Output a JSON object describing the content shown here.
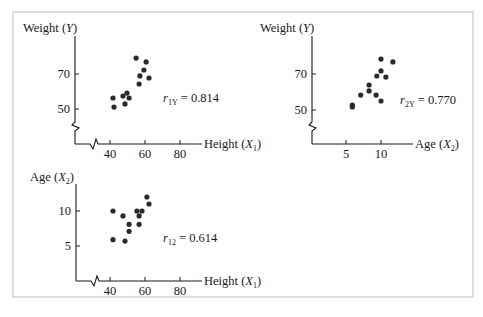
{
  "figure": {
    "frame_color": "#c9c9c9",
    "point_color": "#2a2a2a",
    "axis_color": "#1a1a1a"
  },
  "chart_data": [
    {
      "type": "scatter",
      "id": "height_vs_weight",
      "xlabel": "Height (X1)",
      "xlabel_main": "Height (",
      "xlabel_var": "X",
      "xlabel_sub": "1",
      "ylabel": "Weight (Y)",
      "ylabel_main": "Weight (",
      "ylabel_var": "Y",
      "ylabel_sub": "",
      "x_ticks": [
        40,
        60,
        80
      ],
      "y_ticks": [
        50,
        70
      ],
      "x_break": true,
      "y_break": true,
      "annotation": {
        "var": "r",
        "sub": "1Y",
        "text": " = 0.814",
        "value": 0.814
      },
      "points": [
        {
          "x": 54.9,
          "y": 79.1
        },
        {
          "x": 60.6,
          "y": 76.9
        },
        {
          "x": 59.4,
          "y": 72.3
        },
        {
          "x": 57.1,
          "y": 68.9
        },
        {
          "x": 62.3,
          "y": 67.7
        },
        {
          "x": 56.6,
          "y": 64.3
        },
        {
          "x": 49.7,
          "y": 59.1
        },
        {
          "x": 47.4,
          "y": 57.4
        },
        {
          "x": 50.9,
          "y": 56.3
        },
        {
          "x": 41.7,
          "y": 56.3
        },
        {
          "x": 48.6,
          "y": 52.9
        },
        {
          "x": 42.3,
          "y": 51.1
        }
      ],
      "layout": {
        "origin_px": [
          75,
          144
        ],
        "x_ref": [
          40,
          110
        ],
        "x_scale": 1.75,
        "y_ref": [
          50,
          109
        ],
        "y_scale": 1.75,
        "x_axis_end": 202,
        "y_axis_top": 36
      }
    },
    {
      "type": "scatter",
      "id": "age_vs_weight",
      "xlabel": "Age (X2)",
      "xlabel_main": "Age (",
      "xlabel_var": "X",
      "xlabel_sub": "2",
      "ylabel": "Weight (Y)",
      "ylabel_main": "Weight (",
      "ylabel_var": "Y",
      "ylabel_sub": "",
      "x_ticks": [
        5,
        10
      ],
      "y_ticks": [
        50,
        70
      ],
      "x_break": false,
      "y_break": true,
      "annotation": {
        "var": "r",
        "sub": "2Y",
        "text": " = 0.770",
        "value": 0.77
      },
      "points": [
        {
          "x": 10.0,
          "y": 78.3
        },
        {
          "x": 11.7,
          "y": 76.7
        },
        {
          "x": 10.0,
          "y": 71.7
        },
        {
          "x": 9.4,
          "y": 68.9
        },
        {
          "x": 10.7,
          "y": 68.3
        },
        {
          "x": 8.3,
          "y": 63.9
        },
        {
          "x": 8.3,
          "y": 60.6
        },
        {
          "x": 7.1,
          "y": 58.3
        },
        {
          "x": 9.3,
          "y": 58.3
        },
        {
          "x": 10.0,
          "y": 55.0
        },
        {
          "x": 5.9,
          "y": 52.8
        },
        {
          "x": 5.9,
          "y": 51.7
        }
      ],
      "layout": {
        "origin_px": [
          312,
          144
        ],
        "x_ref": [
          5,
          346
        ],
        "x_scale": 7,
        "y_ref": [
          50,
          110
        ],
        "y_scale": 1.8,
        "x_axis_end": 413,
        "y_axis_top": 36
      }
    },
    {
      "type": "scatter",
      "id": "height_vs_age",
      "xlabel": "Height (X1)",
      "xlabel_main": "Height (",
      "xlabel_var": "X",
      "xlabel_sub": "1",
      "ylabel": "Age (X2)",
      "ylabel_main": "Age (",
      "ylabel_var": "X",
      "ylabel_sub": "2",
      "x_ticks": [
        40,
        60,
        80
      ],
      "y_ticks": [
        5,
        10
      ],
      "x_break": true,
      "y_break": false,
      "annotation": {
        "var": "r",
        "sub": "12",
        "text": " = 0.614",
        "value": 0.614
      },
      "points": [
        {
          "x": 61.1,
          "y": 12.0
        },
        {
          "x": 62.3,
          "y": 11.0
        },
        {
          "x": 41.7,
          "y": 10.0
        },
        {
          "x": 55.4,
          "y": 10.0
        },
        {
          "x": 58.3,
          "y": 10.0
        },
        {
          "x": 47.4,
          "y": 9.3
        },
        {
          "x": 56.6,
          "y": 9.3
        },
        {
          "x": 50.9,
          "y": 8.1
        },
        {
          "x": 56.6,
          "y": 8.1
        },
        {
          "x": 50.9,
          "y": 7.1
        },
        {
          "x": 41.7,
          "y": 5.9
        },
        {
          "x": 48.6,
          "y": 5.7
        }
      ],
      "layout": {
        "origin_px": [
          76,
          281
        ],
        "x_ref": [
          40,
          110
        ],
        "x_scale": 1.75,
        "y_ref": [
          0,
          281
        ],
        "y_scale": 7,
        "x_axis_end": 202,
        "y_axis_top": 184
      }
    }
  ]
}
